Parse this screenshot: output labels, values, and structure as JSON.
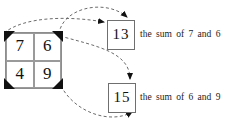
{
  "diagram": {
    "grid": {
      "name": "number-grid",
      "rows": [
        [
          {
            "label": "7"
          },
          {
            "label": "6"
          }
        ],
        [
          {
            "label": "4"
          },
          {
            "label": "9"
          }
        ]
      ],
      "corner_marks": [
        "top-left",
        "top-right",
        "bottom-left",
        "bottom-right"
      ],
      "corner_mark_color": "#111111",
      "border_color": "#8d8d8d"
    },
    "results": [
      {
        "name": "sum-13",
        "value": "13",
        "caption": "the sum of 7 and 6",
        "corner_mark": "top-right"
      },
      {
        "name": "sum-15",
        "value": "15",
        "caption": "the sum of 6 and 9",
        "corner_mark": "right"
      }
    ],
    "arrows": [
      {
        "name": "arrow-7-to-13",
        "from": "grid-cell-7",
        "to": "sum-13",
        "style": "dashed"
      },
      {
        "name": "arrow-6-to-13",
        "from": "grid-cell-6",
        "to": "sum-13",
        "style": "dashed"
      },
      {
        "name": "arrow-6-to-15",
        "from": "grid-cell-6",
        "to": "sum-15",
        "style": "dashed"
      },
      {
        "name": "arrow-9-to-15",
        "from": "grid-cell-9",
        "to": "sum-15",
        "style": "dashed"
      }
    ],
    "stroke_color": "#5a5a5a",
    "text_color": "#1b1b1b"
  }
}
